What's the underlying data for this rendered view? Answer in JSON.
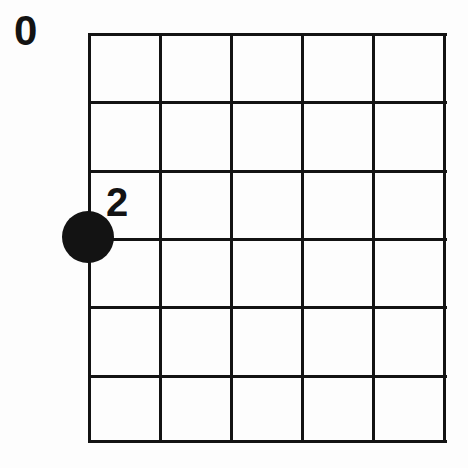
{
  "diagram": {
    "type": "guitar-chord-diagram",
    "background_color": "#fdfdfd",
    "ink_color": "#131313",
    "grid": {
      "left": 88,
      "top": 33,
      "width": 356,
      "height": 410,
      "line_thickness": 3,
      "string_count": 6,
      "fret_count": 6,
      "string_x": [
        0,
        71,
        142,
        213,
        284,
        355
      ],
      "fret_y": [
        0,
        68,
        137,
        205,
        273,
        342,
        407
      ]
    },
    "markers": [
      {
        "name": "open-string-marker",
        "label": "0",
        "kind": "text-label",
        "x": 14,
        "y": 10,
        "font_size": 42
      },
      {
        "name": "finger-number-marker",
        "label": "2",
        "kind": "text-label",
        "x": 106,
        "y": 182,
        "font_size": 40
      }
    ],
    "dots": [
      {
        "name": "finger-dot-1",
        "center_x": 88,
        "center_y": 237,
        "diameter": 52,
        "string_index": 0,
        "fret_line_index": 3,
        "color": "#131313"
      }
    ]
  }
}
